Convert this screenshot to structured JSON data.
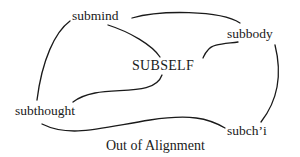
{
  "diagram": {
    "center_label": "SUBSELF",
    "nodes": [
      {
        "id": "submind",
        "label": "submind"
      },
      {
        "id": "subbody",
        "label": "subbody"
      },
      {
        "id": "subthought",
        "label": "subthought"
      },
      {
        "id": "subchi",
        "label": "subch’i"
      }
    ],
    "caption": "Out of Alignment",
    "line_color": "#1a1a1a"
  }
}
